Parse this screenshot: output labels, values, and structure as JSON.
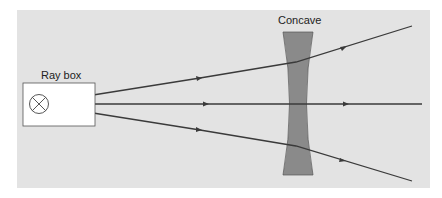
{
  "diagram": {
    "labels": {
      "ray_box": "Ray box",
      "lens": "Concave"
    },
    "colors": {
      "background_panel": "#e3e3e3",
      "lens_fill": "#8a8a8a",
      "ray": "#3a3a3a",
      "ray_box_fill": "#ffffff"
    },
    "rays": [
      {
        "name": "upper-ray",
        "direction": "diverging upward"
      },
      {
        "name": "central-ray",
        "direction": "straight through"
      },
      {
        "name": "lower-ray",
        "direction": "diverging downward"
      }
    ]
  }
}
